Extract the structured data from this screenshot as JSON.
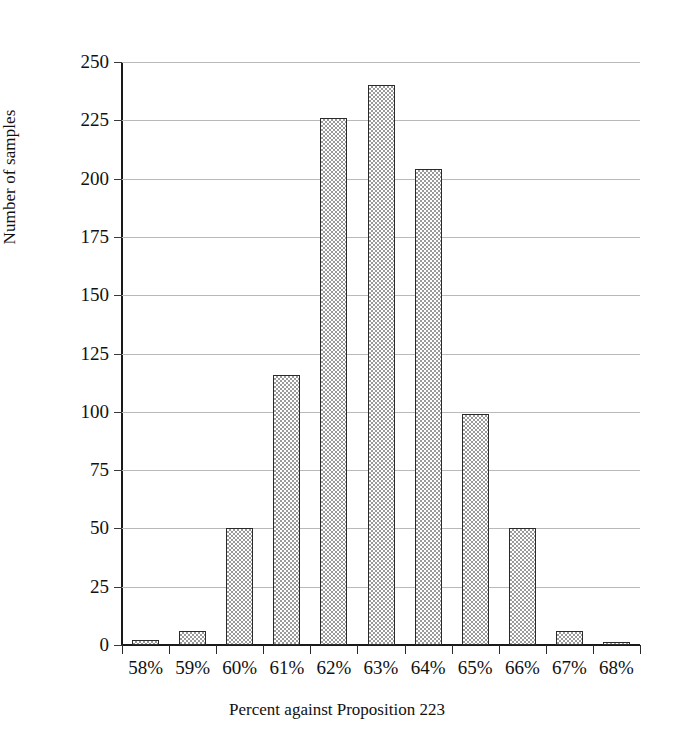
{
  "clipped_title": "",
  "chart_data": {
    "type": "bar",
    "title": "",
    "xlabel": "Percent against Proposition 223",
    "ylabel": "Number of samples",
    "categories": [
      "58%",
      "59%",
      "60%",
      "61%",
      "62%",
      "63%",
      "64%",
      "65%",
      "66%",
      "67%",
      "68%"
    ],
    "values": [
      2,
      6,
      50,
      116,
      226,
      240,
      204,
      99,
      50,
      6,
      1
    ],
    "ylim": [
      0,
      250
    ],
    "ytick_values": [
      0,
      25,
      50,
      75,
      100,
      125,
      150,
      175,
      200,
      225,
      250
    ],
    "ytick_labels": [
      "0",
      "25",
      "50",
      "75",
      "100",
      "125",
      "150",
      "175",
      "200",
      "225",
      "250"
    ],
    "grid": "horizontal",
    "legend": "none",
    "bar_fill_color": "#9a9a9a",
    "bar_edge_color": "#2a2a2a",
    "gridline_color": "#b9b9b9",
    "axis_color": "#1a1a1a"
  }
}
